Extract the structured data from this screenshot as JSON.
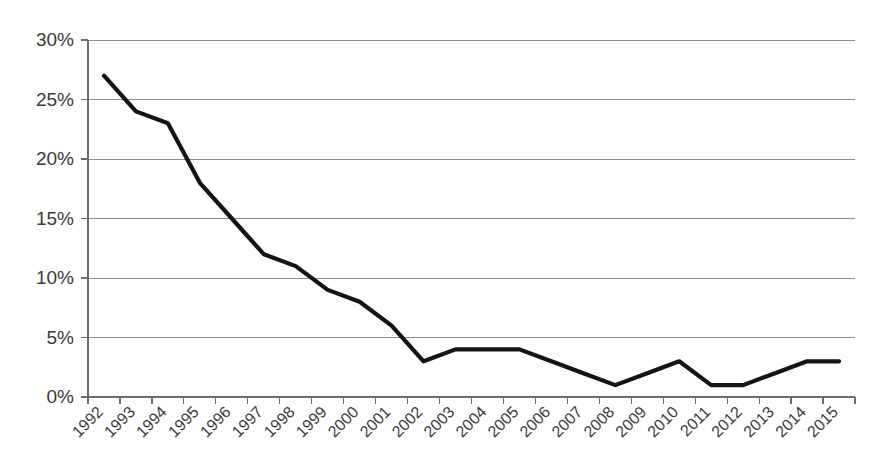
{
  "chart_data": {
    "type": "line",
    "title": "",
    "subtitle": "",
    "xlabel": "",
    "ylabel": "",
    "categories": [
      "1992",
      "1993",
      "1994",
      "1995",
      "1996",
      "1997",
      "1998",
      "1999",
      "2000",
      "2001",
      "2002",
      "2003",
      "2004",
      "2005",
      "2006",
      "2007",
      "2008",
      "2009",
      "2010",
      "2011",
      "2012",
      "2013",
      "2014",
      "2015"
    ],
    "values": [
      27,
      24,
      23,
      18,
      15,
      12,
      11,
      9,
      8,
      6,
      3,
      4,
      4,
      4,
      3,
      2,
      1,
      2,
      3,
      1,
      1,
      2,
      3,
      3
    ],
    "series": [
      {
        "name": "percent",
        "values": [
          27,
          24,
          23,
          18,
          15,
          12,
          11,
          9,
          8,
          6,
          3,
          4,
          4,
          4,
          3,
          2,
          1,
          2,
          3,
          1,
          1,
          2,
          3,
          3
        ]
      }
    ],
    "ylim": [
      0,
      30
    ],
    "ytick_values": [
      0,
      5,
      10,
      15,
      20,
      25,
      30
    ],
    "ytick_labels": [
      "0%",
      "5%",
      "10%",
      "15%",
      "20%",
      "25%",
      "30%"
    ],
    "xtick_labels": [
      "1992",
      "1993",
      "1994",
      "1995",
      "1996",
      "1997",
      "1998",
      "1999",
      "2000",
      "2001",
      "2002",
      "2003",
      "2004",
      "2005",
      "2006",
      "2007",
      "2008",
      "2009",
      "2010",
      "2011",
      "2012",
      "2013",
      "2014",
      "2015"
    ],
    "xtick_rotation_deg": -45,
    "grid": true,
    "grid_axis": "y",
    "legend": false,
    "legend_position": "none",
    "line_color": "#141414",
    "grid_color": "#8c8c8c",
    "axis_color": "#6e6e6e",
    "label_color": "#3a3a3a",
    "background_color": "#ffffff",
    "annotations": []
  },
  "plot_geometry": {
    "left": 88,
    "right": 855,
    "top": 40,
    "bottom": 397
  }
}
